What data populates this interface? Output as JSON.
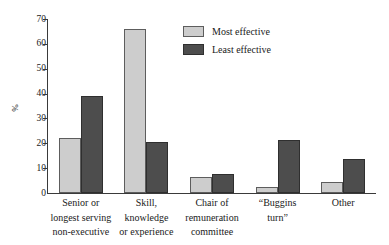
{
  "chart_data": {
    "type": "bar",
    "title": "",
    "subtitle": "",
    "xlabel": "",
    "ylabel": "%",
    "ylim": [
      0,
      70
    ],
    "yticks": [
      0,
      10,
      20,
      30,
      40,
      50,
      60,
      70
    ],
    "grid": false,
    "legend_position": "top-right",
    "categories": [
      [
        "Senior or",
        "longest serving",
        "non-executive"
      ],
      [
        "Skill,",
        "knowledge",
        "or experience"
      ],
      [
        "Chair of",
        "remuneration",
        "committee"
      ],
      [
        "“Buggins",
        "turn”"
      ],
      [
        "Other"
      ]
    ],
    "series": [
      {
        "name": "Most effective",
        "color": "#cdcdcd",
        "values": [
          22,
          66,
          6.5,
          2.5,
          4.5
        ]
      },
      {
        "name": "Least effective",
        "color": "#4d4d4d",
        "values": [
          39,
          20.5,
          7.5,
          21.5,
          13.5
        ]
      }
    ]
  },
  "legend": {
    "items": [
      {
        "label": "Most effective",
        "swatch_name": "legend-swatch-most-effective"
      },
      {
        "label": "Least effective",
        "swatch_name": "legend-swatch-least-effective"
      }
    ]
  },
  "axes": {
    "y_label": "%",
    "y_tick_labels": [
      "70",
      "60",
      "50",
      "40",
      "30",
      "20",
      "10",
      "0"
    ]
  },
  "colors": {
    "most_effective": "#cdcdcd",
    "least_effective": "#4d4d4d",
    "axis": "#3a3a3a",
    "bar_outline_light": "#5d5d5d",
    "bar_outline_dark": "#2f2f2f",
    "background": "#ffffff"
  }
}
